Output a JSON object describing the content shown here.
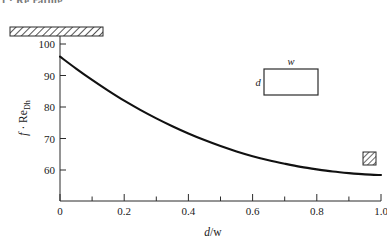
{
  "top_cropped_text": "f · Re rating",
  "chart_data": {
    "type": "line",
    "title": "",
    "xlabel": "d/w",
    "ylabel": "f · ReDh",
    "ylabel_parts": {
      "symbol1": "f",
      "dot": "·",
      "symbol2": "Re",
      "subscript": "Dh"
    },
    "xlabel_parts": {
      "numerator": "d",
      "slash": "/",
      "denominator": "w"
    },
    "xlim": [
      0,
      1.0
    ],
    "ylim": [
      52,
      103
    ],
    "xticks": [
      0,
      0.2,
      0.4,
      0.6,
      0.8,
      1.0
    ],
    "xticklabels": [
      "0",
      "0.2",
      "0.4",
      "0.6",
      "0.8",
      "1.0"
    ],
    "xminorticks": [
      0.1,
      0.3,
      0.5,
      0.7,
      0.9
    ],
    "yticks": [
      60,
      70,
      80,
      90,
      100
    ],
    "yticklabels": [
      "60",
      "70",
      "80",
      "90",
      "100"
    ],
    "grid": false,
    "legend": false,
    "x": [
      0.0,
      0.05,
      0.1,
      0.15,
      0.2,
      0.25,
      0.3,
      0.35,
      0.4,
      0.45,
      0.5,
      0.55,
      0.6,
      0.65,
      0.7,
      0.75,
      0.8,
      0.85,
      0.9,
      0.95,
      1.0
    ],
    "values": [
      96.0,
      92.2,
      88.6,
      85.2,
      82.0,
      79.1,
      76.4,
      73.9,
      71.6,
      69.5,
      67.6,
      65.9,
      64.4,
      63.1,
      62.0,
      61.0,
      60.2,
      59.5,
      59.0,
      58.6,
      58.4
    ],
    "series": [
      {
        "name": "f·Re_Dh rectangular duct",
        "values": [
          96.0,
          92.2,
          88.6,
          85.2,
          82.0,
          79.1,
          76.4,
          73.9,
          71.6,
          69.5,
          67.6,
          65.9,
          64.4,
          63.1,
          62.0,
          61.0,
          60.2,
          59.5,
          59.0,
          58.6,
          58.4
        ]
      }
    ],
    "annotations": [
      {
        "name": "parallel-plates-marker",
        "kind": "hatched-bar",
        "x_value": 0.0,
        "y_value": 96,
        "description": "hatched bar, parallel plates limit"
      },
      {
        "name": "square-duct-marker",
        "kind": "hatched-square",
        "x_value": 1.0,
        "y_value": 63,
        "description": "hatched square, square duct"
      }
    ],
    "inset": {
      "name": "duct-cross-section",
      "width_label": "w",
      "depth_label": "d"
    }
  }
}
